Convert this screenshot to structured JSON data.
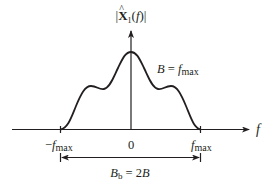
{
  "diagram": {
    "type": "spectrum-magnitude-plot",
    "y_axis_label": {
      "bar_open": "|",
      "symbol": "X",
      "hat": "^",
      "subscript": "1",
      "arg_open": "(",
      "arg": "f",
      "arg_close": ")",
      "bar_close": "|"
    },
    "x_axis_label": "f",
    "tick_labels": {
      "neg_sign": "−",
      "neg_f": "f",
      "neg_sub": "max",
      "zero": "0",
      "pos_f": "f",
      "pos_sub": "max"
    },
    "bandwidth_annotation": {
      "lhs": "B",
      "equals": " = ",
      "rhs_f": "f",
      "rhs_sub": "max"
    },
    "bracket_annotation": {
      "lhs": "B",
      "lhs_sub": "b",
      "equals": " = 2",
      "rhs": "B"
    },
    "curve": {
      "description": "symmetric bandlimited spectrum with central peak and two side shoulders",
      "support": [
        "-fmax",
        "fmax"
      ],
      "peak_at": "0"
    },
    "colors": {
      "stroke": "#231f20",
      "background": "#ffffff"
    }
  }
}
